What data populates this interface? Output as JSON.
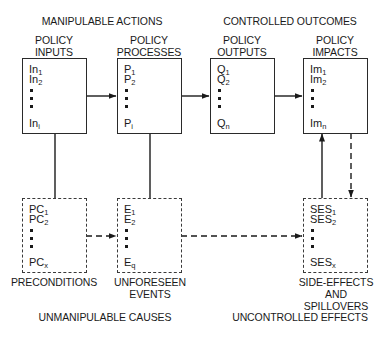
{
  "headers": {
    "top_left": "MANIPULABLE ACTIONS",
    "top_right": "CONTROLLED OUTCOMES",
    "bottom_left": "UNMANIPULABLE CAUSES",
    "bottom_right": "UNCONTROLLED EFFECTS"
  },
  "top_boxes": [
    {
      "title_line1": "POLICY",
      "title_line2": "INPUTS",
      "first": {
        "base": "In",
        "sub": "1"
      },
      "second": {
        "base": "In",
        "sub": "2"
      },
      "last": {
        "base": "In",
        "sub": "i"
      }
    },
    {
      "title_line1": "POLICY",
      "title_line2": "PROCESSES",
      "first": {
        "base": "P",
        "sub": "1"
      },
      "second": {
        "base": "P",
        "sub": "2"
      },
      "last": {
        "base": "P",
        "sub": "i"
      }
    },
    {
      "title_line1": "POLICY",
      "title_line2": "OUTPUTS",
      "first": {
        "base": "Q",
        "sub": "1"
      },
      "second": {
        "base": "Q",
        "sub": "2"
      },
      "last": {
        "base": "Q",
        "sub": "n"
      }
    },
    {
      "title_line1": "POLICY",
      "title_line2": "IMPACTS",
      "first": {
        "base": "Im",
        "sub": "1"
      },
      "second": {
        "base": "Im",
        "sub": "2"
      },
      "last": {
        "base": "Im",
        "sub": "n"
      }
    }
  ],
  "bottom_boxes": [
    {
      "label_lines": [
        "PRECONDITIONS"
      ],
      "first": {
        "base": "PC",
        "sub": "1"
      },
      "second": {
        "base": "PC",
        "sub": "2"
      },
      "last": {
        "base": "PC",
        "sub": "x"
      }
    },
    {
      "label_lines": [
        "UNFORESEEN",
        "EVENTS"
      ],
      "first": {
        "base": "E",
        "sub": "1"
      },
      "second": {
        "base": "E",
        "sub": "2"
      },
      "last": {
        "base": "E",
        "sub": "q"
      }
    },
    {
      "label_lines": [
        "SIDE-EFFECTS",
        "AND",
        "SPILLOVERS"
      ],
      "first": {
        "base": "SES",
        "sub": "1"
      },
      "second": {
        "base": "SES",
        "sub": "2"
      },
      "last": {
        "base": "SES",
        "sub": "x"
      }
    }
  ],
  "connections": [
    {
      "from": "POLICY INPUTS",
      "to": "POLICY PROCESSES",
      "style": "solid",
      "arrow": true
    },
    {
      "from": "POLICY PROCESSES",
      "to": "POLICY OUTPUTS",
      "style": "solid",
      "arrow": true
    },
    {
      "from": "POLICY OUTPUTS",
      "to": "POLICY IMPACTS",
      "style": "solid",
      "arrow": true
    },
    {
      "from": "POLICY INPUTS",
      "to": "PRECONDITIONS",
      "style": "solid",
      "arrow": false
    },
    {
      "from": "POLICY PROCESSES",
      "to": "UNFORESEEN EVENTS",
      "style": "solid",
      "arrow": false
    },
    {
      "from": "PRECONDITIONS",
      "to": "UNFORESEEN EVENTS",
      "style": "dashed",
      "arrow": true
    },
    {
      "from": "UNFORESEEN EVENTS",
      "to": "SIDE-EFFECTS AND SPILLOVERS",
      "style": "dashed",
      "arrow": true
    },
    {
      "from": "SIDE-EFFECTS AND SPILLOVERS",
      "to": "POLICY IMPACTS",
      "style": "solid",
      "arrow": true
    },
    {
      "from": "POLICY IMPACTS",
      "to": "SIDE-EFFECTS AND SPILLOVERS",
      "style": "dashed",
      "arrow": true
    }
  ],
  "colors": {
    "ink": "#1a1a1a",
    "background": "#ffffff"
  }
}
